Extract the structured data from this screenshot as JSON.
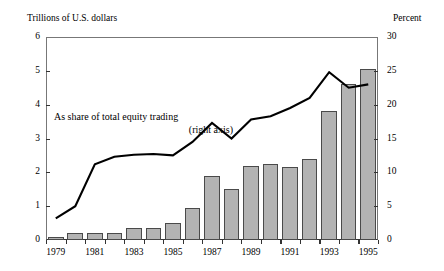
{
  "axis_labels": {
    "left_unit": "Trillions of U.S. dollars",
    "right_unit": "Percent"
  },
  "annotation": {
    "line1": "As share of total equity trading",
    "line2": "(right axis)"
  },
  "chart_data": {
    "type": "bar",
    "title": "",
    "subtitle": "",
    "xlabel": "",
    "ylabel": "Trillions of U.S. dollars",
    "y2label": "Percent",
    "grid": false,
    "legend": "none",
    "ylim": [
      0,
      6
    ],
    "y2lim": [
      0,
      30
    ],
    "yticks": [
      0,
      1,
      2,
      3,
      4,
      5,
      6
    ],
    "y2ticks": [
      0,
      5,
      10,
      15,
      20,
      25,
      30
    ],
    "categories": [
      1979,
      1980,
      1981,
      1982,
      1983,
      1984,
      1985,
      1986,
      1987,
      1988,
      1989,
      1990,
      1991,
      1992,
      1993,
      1994,
      1995
    ],
    "xtick_labels": [
      "1979",
      "1981",
      "1983",
      "1985",
      "1987",
      "1989",
      "1991",
      "1993",
      "1995"
    ],
    "xtick_years": [
      1979,
      1981,
      1983,
      1985,
      1987,
      1989,
      1991,
      1993,
      1995
    ],
    "series": [
      {
        "name": "Value of equity trading",
        "type": "bar",
        "axis": "left",
        "unit": "Trillions of U.S. dollars",
        "color": "#b3b3b3",
        "edge_color": "#4a4a4a",
        "values": [
          0.1,
          0.2,
          0.2,
          0.2,
          0.35,
          0.35,
          0.5,
          0.95,
          1.9,
          1.5,
          2.2,
          2.25,
          2.15,
          2.4,
          3.8,
          4.6,
          5.05
        ]
      },
      {
        "name": "As share of total equity trading",
        "type": "line",
        "axis": "right",
        "unit": "Percent",
        "color": "#000000",
        "values": [
          3.2,
          5.0,
          11.2,
          12.3,
          12.6,
          12.7,
          12.5,
          14.5,
          17.3,
          15.0,
          17.8,
          18.3,
          19.5,
          21.0,
          24.8,
          22.5,
          23.0
        ]
      }
    ]
  }
}
